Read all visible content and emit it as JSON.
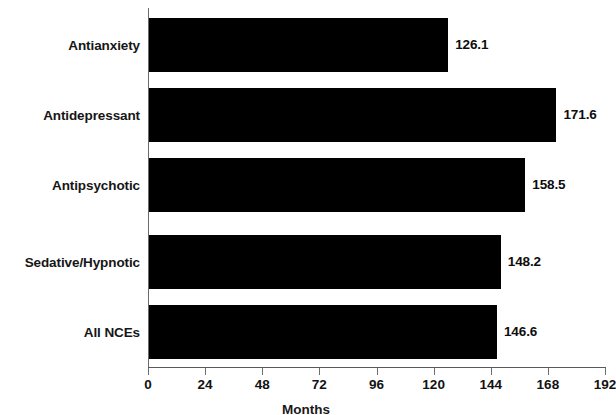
{
  "chart_data": {
    "type": "bar",
    "orientation": "horizontal",
    "title": "",
    "xlabel": "Months",
    "ylabel": "",
    "xlim": [
      0,
      192
    ],
    "xticks": [
      0,
      24,
      48,
      72,
      96,
      120,
      144,
      168,
      192
    ],
    "grid": false,
    "legend": null,
    "bar_color": "#000000",
    "background_color": "#ffffff",
    "categories": [
      "Antianxiety",
      "Antidepressant",
      "Antipsychotic",
      "Sedative/Hypnotic",
      "All NCEs"
    ],
    "values": [
      126.1,
      171.6,
      158.5,
      148.2,
      146.6
    ],
    "value_labels": [
      "126.1",
      "171.6",
      "158.5",
      "148.2",
      "146.6"
    ],
    "tick_labels": [
      "0",
      "24",
      "48",
      "72",
      "96",
      "120",
      "144",
      "168",
      "192"
    ]
  }
}
